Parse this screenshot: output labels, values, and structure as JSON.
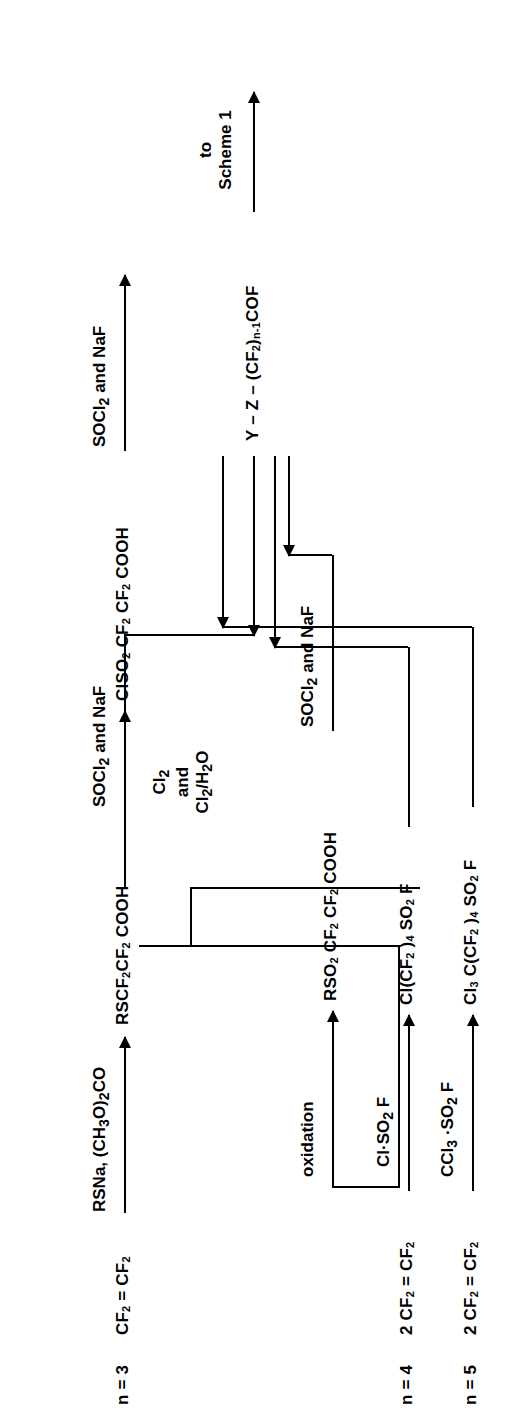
{
  "figure": {
    "kind": "chemical-reaction-scheme",
    "orientation": "rotated-90-ccw",
    "ink_color": "#000000",
    "background_color": "#ffffff"
  },
  "top_exit": {
    "label_line1": "to",
    "label_line2": "Scheme 1"
  },
  "product": {
    "formula_prefix": "Y",
    "dash1": "–",
    "z": "Z",
    "dash2": "–",
    "cf2_open": "(CF",
    "cf2_sub": "2",
    "cf2_close": ")",
    "n_minus_1": "n-1",
    "cof": "COF",
    "full_text": "Y – Z – (CF2)n-1COF"
  },
  "rows": [
    {
      "n_label": "n = 3",
      "start": "CF2 = CF2",
      "start_parts": {
        "pre": "CF",
        "sub1": "2",
        "eq": " = CF",
        "sub2": "2"
      },
      "steps": [
        {
          "reagent": "RSNa, (CH3O)2CO",
          "product": "RSCF2CF2COOH"
        },
        {
          "reagent": "SOCl2 and NaF",
          "product": "to Y-Z-(CF2)n-1COF"
        }
      ]
    },
    {
      "n_label": "",
      "branch_reagent_lines": [
        "Cl2",
        "and",
        "Cl2/H2O"
      ],
      "steps": [
        {
          "reagent": "Cl2 and Cl2/H2O",
          "product": "ClSO2CF2CF2COOH"
        },
        {
          "reagent": "SOCl2 and NaF",
          "product": "to Y-Z-(CF2)n-1COF"
        }
      ]
    },
    {
      "n_label": "",
      "steps": [
        {
          "reagent": "oxidation",
          "product": "RSO2CF2CF2COOH"
        },
        {
          "reagent": "SOCl2 and NaF",
          "product": "to Y-Z-(CF2)n-1COF"
        }
      ]
    },
    {
      "n_label": "n = 4",
      "start": "2 CF2 = CF2",
      "steps": [
        {
          "reagent": "Cl·SO2F",
          "product": "Cl(CF2)4SO2F"
        }
      ]
    },
    {
      "n_label": "n = 5",
      "start": "2 CF2 = CF2",
      "steps": [
        {
          "reagent": "CCl3·SO2F",
          "product": "Cl3C(CF2)4SO2F"
        }
      ]
    }
  ],
  "labels": {
    "n3": "n = 3",
    "n4": "n = 4",
    "n5": "n = 5",
    "tfe": "CF2 = CF2",
    "tfe2": "2 CF2 = CF2",
    "reagent_rsna": "RSNa, (CH3O)2CO",
    "reagent_socl2_naf": "SOCl2 and NaF",
    "reagent_cl2": "Cl2",
    "reagent_and": "and",
    "reagent_cl2_h2o": "Cl2/H2O",
    "reagent_oxidation": "oxidation",
    "reagent_cl_so2f": "Cl·SO2F",
    "reagent_ccl3_so2f": "CCl3·SO2F",
    "prod_rscf2": "RSCF2CF2COOH",
    "prod_clso2": "ClSO2CF2CF2COOH",
    "prod_rso2": "RSO2CF2CF2COOH",
    "prod_cl_cf2_4": "Cl(CF2)4SO2F",
    "prod_cl3c": "Cl3C(CF2)4SO2F",
    "to": "to",
    "scheme1": "Scheme 1"
  }
}
